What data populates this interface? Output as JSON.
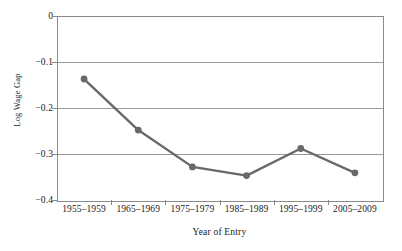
{
  "chart_data": {
    "type": "line",
    "title": "",
    "subtitle": "",
    "xlabel": "Year of Entry",
    "ylabel": "Log Wage Gap",
    "categories": [
      "1955–1959",
      "1965–1969",
      "1975–1979",
      "1985–1989",
      "1995–1999",
      "2005–2009"
    ],
    "values": [
      -0.137,
      -0.248,
      -0.328,
      -0.347,
      -0.288,
      -0.341
    ],
    "series": [
      {
        "name": "Log Wage Gap",
        "values": [
          -0.137,
          -0.248,
          -0.328,
          -0.347,
          -0.288,
          -0.341
        ]
      }
    ],
    "ylim": [
      -0.4,
      0
    ],
    "yticks": [
      0,
      -0.1,
      -0.2,
      -0.3,
      -0.4
    ],
    "ytick_labels": [
      "0",
      "−0.1",
      "−0.2",
      "−0.3",
      "−0.4"
    ],
    "grid": "horizontal",
    "legend": "none",
    "line_color": "#696969",
    "marker_color": "#696969",
    "marker_shape": "circle",
    "axis_color": "#8a8a8a",
    "gridline_color": "#9a9a9a",
    "background_color": "#ffffff"
  }
}
